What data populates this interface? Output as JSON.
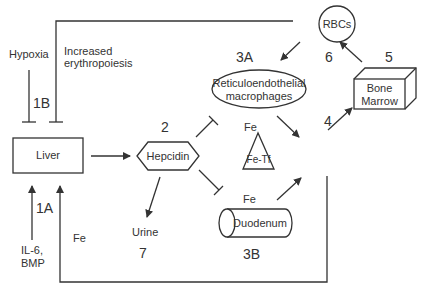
{
  "nodes": {
    "liver": "Liver",
    "hepcidin": "Hepcidin",
    "macrophages_line1": "Reticuloendothelial",
    "macrophages_line2": "macrophages",
    "duodenum": "Duodenum",
    "fe_tf": "Fe-Tf",
    "bone_marrow_line1": "Bone",
    "bone_marrow_line2": "Marrow",
    "rbcs": "RBCs",
    "urine": "Urine"
  },
  "labels": {
    "hypoxia": "Hypoxia",
    "increased_line1": "Increased",
    "increased_line2": "erythropoiesis",
    "il6_line1": "IL-6,",
    "il6_line2": "BMP",
    "fe_macrophage": "Fe",
    "fe_duodenum": "Fe",
    "fe_liver": "Fe"
  },
  "step_numbers": {
    "s1a": "1A",
    "s1b": "1B",
    "s2": "2",
    "s3a": "3A",
    "s3b": "3B",
    "s4": "4",
    "s5": "5",
    "s6": "6",
    "s7": "7"
  },
  "colors": {
    "stroke": "#333333",
    "background": "#ffffff"
  }
}
